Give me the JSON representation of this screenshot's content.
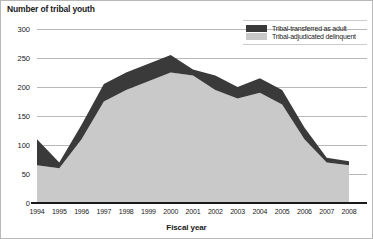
{
  "chart_data": {
    "type": "area",
    "title": "Number of tribal youth",
    "xlabel": "Fiscal year",
    "ylabel": "Number of tribal youth",
    "stacked": true,
    "grid": true,
    "legend_position": "top-right",
    "categories": [
      1994,
      1995,
      1996,
      1997,
      1998,
      1999,
      2000,
      2001,
      2002,
      2003,
      2004,
      2005,
      2006,
      2007,
      2008
    ],
    "x_tick_labels": [
      "1994",
      "1995",
      "1996",
      "1997",
      "1998",
      "1999",
      "2000",
      "2001",
      "2002",
      "2003",
      "2004",
      "2005",
      "2006",
      "2007",
      "2008"
    ],
    "y_tick_labels": [
      "0",
      "50",
      "100",
      "150",
      "200",
      "250",
      "300"
    ],
    "y_ticks": [
      0,
      50,
      100,
      150,
      200,
      250,
      300
    ],
    "ylim": [
      0,
      300
    ],
    "xlim": [
      1994,
      2008
    ],
    "series": [
      {
        "name": "Tribal-adjudicated delinquent",
        "color": "#c9c9c9",
        "values": [
          65,
          60,
          110,
          175,
          195,
          210,
          225,
          220,
          195,
          180,
          190,
          170,
          110,
          70,
          65
        ]
      },
      {
        "name": "Tribal-transferred as adult",
        "color": "#3a3a3a",
        "values": [
          45,
          10,
          25,
          30,
          30,
          30,
          30,
          10,
          25,
          20,
          25,
          25,
          20,
          8,
          7
        ]
      }
    ],
    "totals": [
      110,
      70,
      135,
      205,
      225,
      240,
      255,
      230,
      220,
      200,
      215,
      195,
      130,
      78,
      72
    ]
  },
  "legend": {
    "items": [
      {
        "label": "Tribal-transferred as adult",
        "color": "#3a3a3a"
      },
      {
        "label": "Tribal-adjudicated delinquent",
        "color": "#c9c9c9"
      }
    ]
  },
  "colors": {
    "transferred": "#3a3a3a",
    "delinquent": "#c9c9c9",
    "gridline": "#9a9a9a",
    "axis": "#1a1a1a",
    "background": "#ffffff"
  }
}
